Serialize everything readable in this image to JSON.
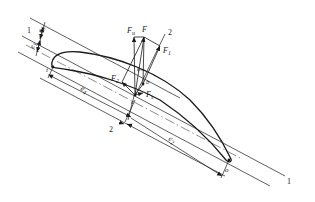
{
  "diagram": {
    "type": "airfoil force diagram",
    "section_labels": {
      "section_1_top": "1",
      "section_1_bottom": "1",
      "section_2_top": "2",
      "section_2_bottom": "2"
    },
    "points": {
      "leading_edge": "i",
      "trailing_edge": "o",
      "force_point_b": "b",
      "force_point_c": "c"
    },
    "forces": {
      "F": "F",
      "Fu": {
        "main": "F",
        "sub": "u"
      },
      "F1": {
        "main": "F",
        "sub": "1"
      },
      "F2": {
        "main": "F",
        "sub": "2"
      },
      "Fs": {
        "main": "F",
        "sub": "s"
      }
    },
    "angle": "φ",
    "dimensions": {
      "e1": {
        "main": "e",
        "sub": "1"
      },
      "e3": {
        "main": "e",
        "sub": "3"
      },
      "e4": {
        "main": "e",
        "sub": "4"
      },
      "e2": {
        "main": "e",
        "sub": "2"
      }
    },
    "colors": {
      "stroke": "#1a1a1a",
      "background": "#ffffff"
    }
  }
}
